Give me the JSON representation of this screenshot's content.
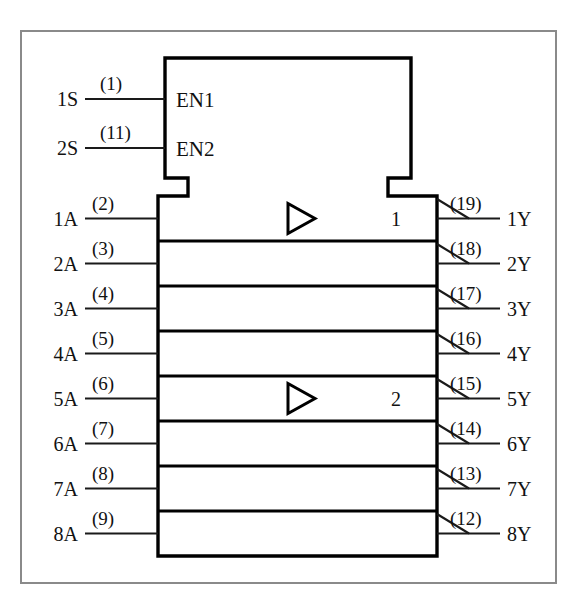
{
  "diagram": {
    "device_body": {
      "control_block_label_1": "EN1",
      "control_block_label_2": "EN2",
      "group_marker_1": "1",
      "group_marker_2": "2",
      "buffer_icon_name": "buffer-triangle-icon"
    },
    "control_pins": [
      {
        "signal": "1S",
        "pin": "(1)",
        "internal": "EN1"
      },
      {
        "signal": "2S",
        "pin": "(11)",
        "internal": "EN2"
      }
    ],
    "inputs": [
      {
        "signal": "1A",
        "pin": "(2)"
      },
      {
        "signal": "2A",
        "pin": "(3)"
      },
      {
        "signal": "3A",
        "pin": "(4)"
      },
      {
        "signal": "4A",
        "pin": "(5)"
      },
      {
        "signal": "5A",
        "pin": "(6)"
      },
      {
        "signal": "6A",
        "pin": "(7)"
      },
      {
        "signal": "7A",
        "pin": "(8)"
      },
      {
        "signal": "8A",
        "pin": "(9)"
      }
    ],
    "outputs": [
      {
        "signal": "1Y",
        "pin": "(19)"
      },
      {
        "signal": "2Y",
        "pin": "(18)"
      },
      {
        "signal": "3Y",
        "pin": "(17)"
      },
      {
        "signal": "4Y",
        "pin": "(16)"
      },
      {
        "signal": "5Y",
        "pin": "(15)"
      },
      {
        "signal": "6Y",
        "pin": "(14)"
      },
      {
        "signal": "7Y",
        "pin": "(13)"
      },
      {
        "signal": "8Y",
        "pin": "(12)"
      }
    ],
    "colors": {
      "line": "#1a1a1a",
      "body_stroke": "#000000",
      "frame": "#8a8a8a",
      "background": "#ffffff"
    }
  }
}
